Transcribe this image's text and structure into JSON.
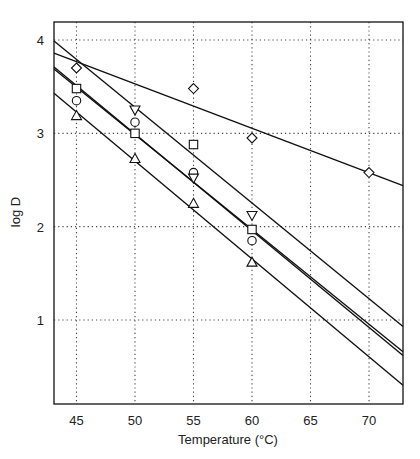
{
  "chart_data": {
    "type": "scatter",
    "title": "",
    "xlabel": "Temperature (°C)",
    "ylabel": "log D",
    "xlim": [
      43,
      73
    ],
    "ylim": [
      0,
      4.25
    ],
    "xticks": [
      45,
      50,
      55,
      60,
      65,
      70
    ],
    "yticks": [
      1,
      2,
      3,
      4
    ],
    "grid": true,
    "legend": null,
    "series": [
      {
        "name": "diamond",
        "marker": "diamond",
        "x": [
          45,
          55,
          60,
          70
        ],
        "y": [
          3.7,
          3.48,
          2.95,
          2.58
        ],
        "fit_line": {
          "x": [
            43,
            73
          ],
          "y": [
            3.86,
            2.44
          ]
        }
      },
      {
        "name": "square",
        "marker": "square",
        "x": [
          45,
          50,
          55,
          60
        ],
        "y": [
          3.48,
          3.0,
          2.88,
          1.97
        ],
        "fit_line": {
          "x": [
            43,
            73
          ],
          "y": [
            3.71,
            0.62
          ]
        }
      },
      {
        "name": "circle",
        "marker": "circle",
        "x": [
          45,
          50,
          55,
          60
        ],
        "y": [
          3.35,
          3.12,
          2.58,
          1.85
        ],
        "fit_line": {
          "x": [
            43,
            73
          ],
          "y": [
            3.69,
            0.66
          ]
        }
      },
      {
        "name": "triangle-down",
        "marker": "triangle-down",
        "x": [
          50,
          55,
          60
        ],
        "y": [
          3.25,
          2.52,
          2.12
        ],
        "fit_line": {
          "x": [
            43,
            73
          ],
          "y": [
            3.99,
            0.93
          ]
        }
      },
      {
        "name": "triangle-up",
        "marker": "triangle-up",
        "x": [
          45,
          50,
          55,
          60
        ],
        "y": [
          3.19,
          2.73,
          2.25,
          1.62
        ],
        "fit_line": {
          "x": [
            43,
            73
          ],
          "y": [
            3.43,
            0.3
          ]
        }
      }
    ]
  }
}
